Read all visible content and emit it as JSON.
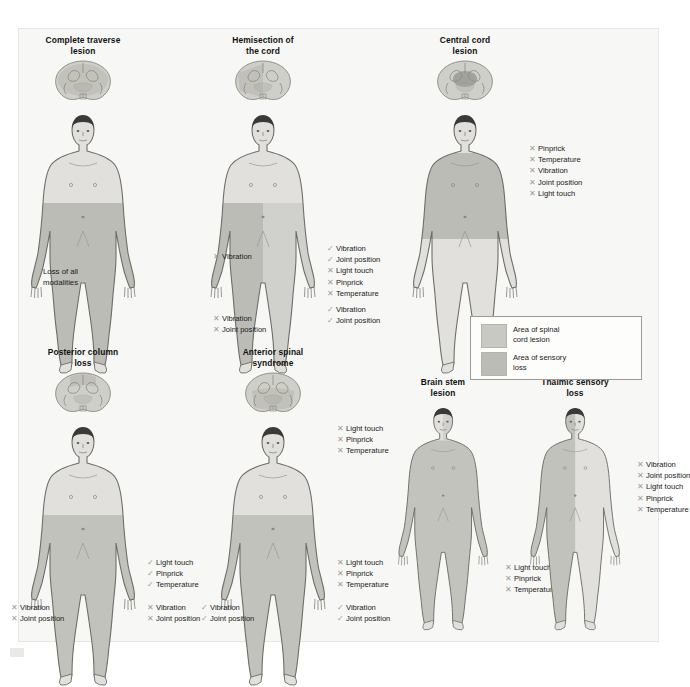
{
  "figure": {
    "legend": {
      "items": [
        {
          "label": "Area of spinal\ncord lesion",
          "color": "#c9c9c4"
        },
        {
          "label": "Area of sensory\nloss",
          "color": "#bcbcb6"
        }
      ]
    },
    "panels": [
      {
        "id": "complete-traverse-lesion",
        "title": "Complete traverse\nlesion",
        "cord_type": "complete",
        "plain_labels": [
          {
            "text": "Loss of all\nmodalities",
            "x": 16,
            "y": 232
          }
        ],
        "lists": []
      },
      {
        "id": "hemisection-of-the-cord",
        "title": "Hemisection of\nthe cord",
        "cord_type": "hemisection",
        "plain_labels": [],
        "lists": [
          {
            "name": "left-upper",
            "x": 6,
            "y": 216,
            "rows": [
              {
                "mark": "x",
                "text": "Vibration"
              }
            ]
          },
          {
            "name": "right-upper",
            "x": 120,
            "y": 208,
            "rows": [
              {
                "mark": "v",
                "text": "Vibration"
              },
              {
                "mark": "v",
                "text": "Joint position"
              },
              {
                "mark": "x",
                "text": "Light touch"
              },
              {
                "mark": "x",
                "text": "Pinprick"
              },
              {
                "mark": "x",
                "text": "Temperature"
              },
              {
                "mark": "v",
                "text": "Vibration"
              },
              {
                "mark": "v",
                "text": "Joint position"
              }
            ]
          },
          {
            "name": "left-lower",
            "x": 6,
            "y": 278,
            "rows": [
              {
                "mark": "x",
                "text": "Vibration"
              },
              {
                "mark": "x",
                "text": "Joint position"
              }
            ]
          }
        ]
      },
      {
        "id": "central-cord-lesion",
        "title": "Central cord\nlesion",
        "cord_type": "central",
        "plain_labels": [],
        "lists": [
          {
            "name": "right-upper",
            "x": 120,
            "y": 108,
            "rows": [
              {
                "mark": "x",
                "text": "Pinprick"
              },
              {
                "mark": "x",
                "text": "Temperature"
              },
              {
                "mark": "x",
                "text": "Vibration"
              },
              {
                "mark": "x",
                "text": "Joint position"
              },
              {
                "mark": "x",
                "text": "Light touch"
              }
            ]
          }
        ]
      },
      {
        "id": "posterior-column-loss",
        "title": "Posterior column\nloss",
        "cord_type": "posterior",
        "plain_labels": [],
        "lists": [
          {
            "name": "right-lower",
            "x": 120,
            "y": 210,
            "rows": [
              {
                "mark": "v",
                "text": "Light touch"
              },
              {
                "mark": "v",
                "text": "Pinprick"
              },
              {
                "mark": "v",
                "text": "Temperature"
              }
            ]
          },
          {
            "name": "left-feet",
            "x": -16,
            "y": 255,
            "rows": [
              {
                "mark": "x",
                "text": "Vibration"
              },
              {
                "mark": "x",
                "text": "Joint position"
              }
            ]
          },
          {
            "name": "right-feet",
            "x": 120,
            "y": 255,
            "rows": [
              {
                "mark": "x",
                "text": "Vibration"
              },
              {
                "mark": "x",
                "text": "Joint position"
              }
            ]
          }
        ]
      },
      {
        "id": "anterior-spinal-syndrome",
        "title": "Anterior spinal\nsyndrome",
        "cord_type": "anterior",
        "plain_labels": [],
        "lists": [
          {
            "name": "right-upper",
            "x": 120,
            "y": 76,
            "rows": [
              {
                "mark": "x",
                "text": "Light touch"
              },
              {
                "mark": "x",
                "text": "Pinprick"
              },
              {
                "mark": "x",
                "text": "Temperature"
              }
            ]
          },
          {
            "name": "right-lower",
            "x": 120,
            "y": 210,
            "rows": [
              {
                "mark": "x",
                "text": "Light touch"
              },
              {
                "mark": "x",
                "text": "Pinprick"
              },
              {
                "mark": "x",
                "text": "Temperature"
              }
            ]
          },
          {
            "name": "left-feet",
            "x": -16,
            "y": 255,
            "rows": [
              {
                "mark": "v",
                "text": "Vibration"
              },
              {
                "mark": "v",
                "text": "Joint position"
              }
            ]
          },
          {
            "name": "right-feet",
            "x": 120,
            "y": 255,
            "rows": [
              {
                "mark": "v",
                "text": "Vibration"
              },
              {
                "mark": "v",
                "text": "Joint position"
              }
            ]
          }
        ]
      },
      {
        "id": "brain-stem-lesion",
        "title": "Brain stem\nlesion",
        "cord_type": "brainstem",
        "plain_labels": [],
        "lists": [
          {
            "name": "right-lower",
            "x": 118,
            "y": 185,
            "rows": [
              {
                "mark": "x",
                "text": "Light touch"
              },
              {
                "mark": "x",
                "text": "Pinprick"
              },
              {
                "mark": "x",
                "text": "Temperature"
              }
            ]
          }
        ]
      },
      {
        "id": "thalmic-sensory-loss",
        "title": "Thalmic sensory\nloss",
        "cord_type": "thalamic",
        "plain_labels": [],
        "lists": [
          {
            "name": "right-upper",
            "x": 118,
            "y": 82,
            "rows": [
              {
                "mark": "x",
                "text": "Vibration"
              },
              {
                "mark": "x",
                "text": "Joint position"
              },
              {
                "mark": "x",
                "text": "Light touch"
              },
              {
                "mark": "x",
                "text": "Pinprick"
              },
              {
                "mark": "x",
                "text": "Temperature"
              }
            ]
          }
        ]
      }
    ]
  },
  "colors": {
    "background": "#f7f7f5",
    "skin": "#e2e0dc",
    "lesion_shade": "#c9c9c4",
    "sensory_shade": "#bcbcb6",
    "outline": "#6e6e68",
    "hair": "#3a3a38",
    "mark": "#9b9b9b"
  }
}
